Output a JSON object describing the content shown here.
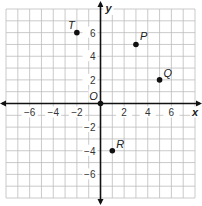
{
  "chart_data": {
    "type": "scatter",
    "title": "",
    "xlabel": "x",
    "ylabel": "y",
    "origin_label": "O",
    "xlim": [
      -8,
      8
    ],
    "ylim": [
      -8,
      8
    ],
    "grid": true,
    "x_ticks": [
      -6,
      -4,
      -2,
      2,
      4,
      6
    ],
    "y_ticks": [
      6,
      4,
      2,
      -2,
      -4,
      -6
    ],
    "x_tick_labels": [
      "−6",
      "−4",
      "−2",
      "2",
      "4",
      "6"
    ],
    "y_tick_labels": [
      "6",
      "4",
      "2",
      "−2",
      "−4",
      "−6"
    ],
    "points": [
      {
        "label": "T",
        "x": -2,
        "y": 6
      },
      {
        "label": "P",
        "x": 3,
        "y": 5
      },
      {
        "label": "Q",
        "x": 5,
        "y": 2
      },
      {
        "label": "R",
        "x": 1,
        "y": -4
      },
      {
        "label": "O",
        "x": 0,
        "y": 0
      }
    ]
  }
}
